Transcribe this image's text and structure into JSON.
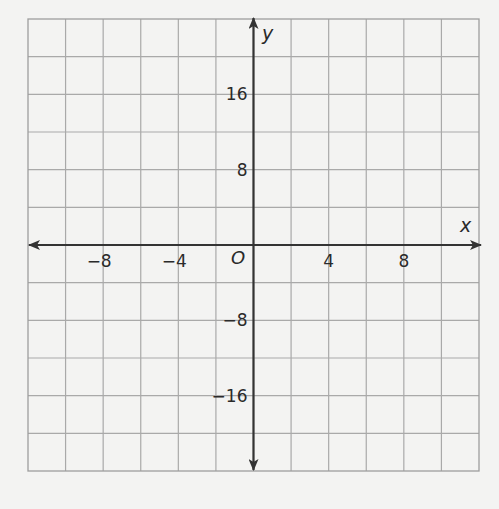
{
  "chart_data": {
    "type": "coordinate-grid",
    "title": "",
    "xlabel": "x",
    "ylabel": "y",
    "origin_label": "O",
    "xlim": [
      -12,
      12
    ],
    "ylim": [
      -24,
      24
    ],
    "x_grid_step": 2,
    "y_grid_step": 4,
    "grid": true,
    "grid_columns": 12,
    "grid_rows": 12,
    "x_ticks": [
      {
        "value": -8,
        "label": "−8"
      },
      {
        "value": -4,
        "label": "−4"
      },
      {
        "value": 4,
        "label": "4"
      },
      {
        "value": 8,
        "label": "8"
      }
    ],
    "y_ticks": [
      {
        "value": 16,
        "label": "16"
      },
      {
        "value": 8,
        "label": "8"
      },
      {
        "value": -8,
        "label": "−8"
      },
      {
        "value": -16,
        "label": "−16"
      }
    ],
    "series": [],
    "legend": null
  },
  "colors": {
    "background": "#f3f3f2",
    "grid_line": "#a9a9a9",
    "grid_border": "#9d9d9d",
    "axis": "#333333",
    "text": "#2a2a2a"
  },
  "layout": {
    "grid_left": 28,
    "grid_top": 19,
    "grid_right": 479,
    "grid_bottom": 471
  }
}
